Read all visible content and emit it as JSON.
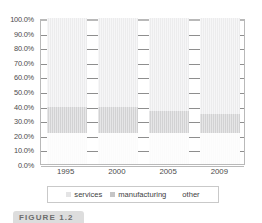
{
  "chart_data": {
    "type": "bar",
    "stacked": true,
    "stack_mode": "percent",
    "title": "",
    "subtitle": "",
    "xlabel": "",
    "ylabel": "",
    "categories": [
      "1995",
      "2000",
      "2005",
      "2009"
    ],
    "ylim": [
      0,
      100
    ],
    "ytick_values": [
      0,
      10,
      20,
      30,
      40,
      50,
      60,
      70,
      80,
      90,
      100
    ],
    "ytick_labels": [
      "0.0%",
      "10.0%",
      "20.0%",
      "30.0%",
      "40.0%",
      "50.0%",
      "60.0%",
      "70.0%",
      "80.0%",
      "90.0%",
      "100.0%"
    ],
    "grid": true,
    "grid_axis": "y",
    "legend_position": "bottom",
    "stack_order_bottom_to_top": [
      "other",
      "manufacturing",
      "services"
    ],
    "series": [
      {
        "name": "services",
        "color": "#ececed",
        "values": [
          61.0,
          61.0,
          64.0,
          66.0
        ]
      },
      {
        "name": "manufacturing",
        "color": "#d2d2d3",
        "values": [
          18.0,
          18.0,
          15.0,
          13.0
        ]
      },
      {
        "name": "other",
        "color": "#fbfbfb",
        "values": [
          21.0,
          21.0,
          21.0,
          21.0
        ]
      }
    ],
    "segment_boundaries_percent": [
      {
        "category": "1995",
        "other": [
          0,
          21
        ],
        "manufacturing": [
          21,
          39
        ],
        "services": [
          39,
          100
        ]
      },
      {
        "category": "2000",
        "other": [
          0,
          21
        ],
        "manufacturing": [
          21,
          39
        ],
        "services": [
          39,
          100
        ]
      },
      {
        "category": "2005",
        "other": [
          0,
          21
        ],
        "manufacturing": [
          21,
          36
        ],
        "services": [
          36,
          100
        ]
      },
      {
        "category": "2009",
        "other": [
          0,
          21
        ],
        "manufacturing": [
          21,
          34
        ],
        "services": [
          34,
          100
        ]
      }
    ]
  },
  "legend": {
    "items": [
      {
        "label": "services",
        "swatch_class": "services"
      },
      {
        "label": "manufacturing",
        "swatch_class": "manufacturing"
      },
      {
        "label": "other",
        "swatch_class": "other"
      }
    ]
  },
  "caption": {
    "badge_text": "FIGURE 1.2"
  },
  "colors": {
    "services": "#ececed",
    "manufacturing": "#d2d2d3",
    "other": "#fbfbfb",
    "gridline": "#8e8e8e",
    "axis": "#b9b9b9",
    "label_text": "#4b4b4b",
    "legend_border": "#c9c9c9",
    "caption_badge": "#dddddd"
  }
}
